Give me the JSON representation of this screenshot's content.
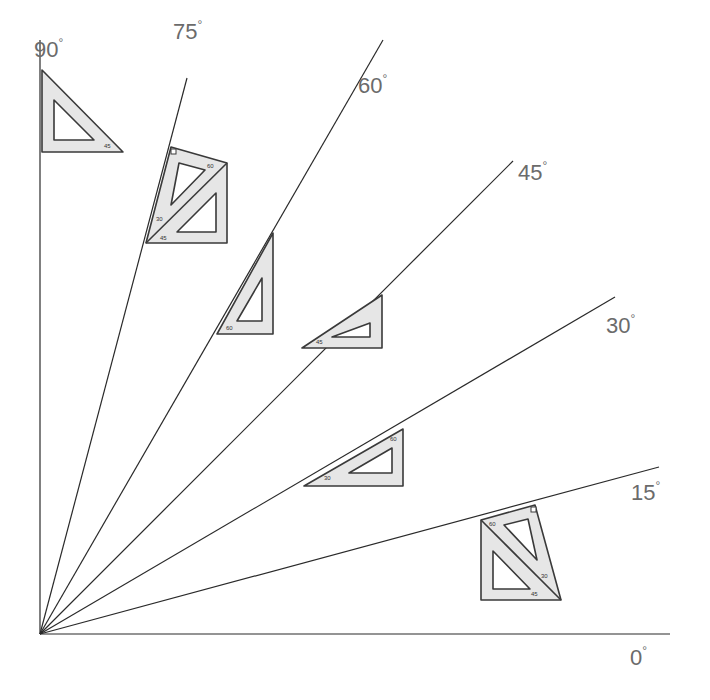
{
  "diagram": {
    "type": "protractor-fan",
    "colors": {
      "line": "#2a2a2a",
      "triangle_fill": "#e6e6e6",
      "triangle_stroke": "#3a3a3a",
      "label": "#6b6b6b",
      "background": "#ffffff"
    },
    "origin": {
      "x": 40,
      "y": 634
    },
    "angles": [
      {
        "id": "a0",
        "value": "0",
        "unit": "°"
      },
      {
        "id": "a15",
        "value": "15",
        "unit": "°"
      },
      {
        "id": "a30",
        "value": "30",
        "unit": "°"
      },
      {
        "id": "a45",
        "value": "45",
        "unit": "°"
      },
      {
        "id": "a60",
        "value": "60",
        "unit": "°"
      },
      {
        "id": "a75",
        "value": "75",
        "unit": "°"
      },
      {
        "id": "a90",
        "value": "90",
        "unit": "°"
      }
    ],
    "set_squares": [
      {
        "angle": "90",
        "pieces": [
          {
            "kind": "45-triangle",
            "mark": "45"
          }
        ]
      },
      {
        "angle": "75",
        "pieces": [
          {
            "kind": "30-60-triangle",
            "marks": [
              "60",
              "30"
            ]
          },
          {
            "kind": "45-triangle",
            "mark": "45"
          }
        ]
      },
      {
        "angle": "60",
        "pieces": [
          {
            "kind": "30-60-triangle",
            "mark": "60"
          }
        ]
      },
      {
        "angle": "45",
        "pieces": [
          {
            "kind": "45-triangle",
            "mark": "45"
          }
        ]
      },
      {
        "angle": "30",
        "pieces": [
          {
            "kind": "30-60-triangle",
            "marks": [
              "30",
              "60"
            ]
          }
        ]
      },
      {
        "angle": "15",
        "pieces": [
          {
            "kind": "30-60-triangle",
            "marks": [
              "60",
              "30"
            ]
          },
          {
            "kind": "45-triangle",
            "mark": "45"
          }
        ]
      }
    ],
    "marks": {
      "m90": "45",
      "m75a": "60",
      "m75b": "30",
      "m75c": "45",
      "m60": "60",
      "m45": "45",
      "m30a": "30",
      "m30b": "60",
      "m15a": "60",
      "m15b": "30",
      "m15c": "45"
    }
  }
}
